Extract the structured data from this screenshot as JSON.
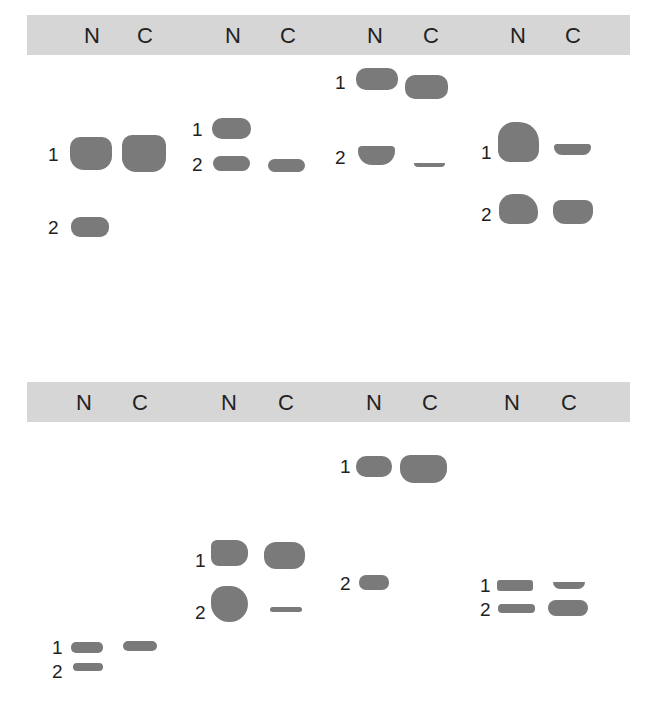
{
  "panels": [
    {
      "name": "top",
      "bar_top": 15,
      "lane_labels": [
        "N",
        "C",
        "N",
        "C",
        "N",
        "C",
        "N",
        "C"
      ],
      "lane_x": [
        92,
        145,
        233,
        288,
        375,
        431,
        518,
        573
      ],
      "label_y": 25,
      "band_labels": [
        {
          "text": "1",
          "x": 48,
          "y": 145
        },
        {
          "text": "2",
          "x": 48,
          "y": 218
        },
        {
          "text": "1",
          "x": 192,
          "y": 120
        },
        {
          "text": "2",
          "x": 192,
          "y": 155
        },
        {
          "text": "1",
          "x": 335,
          "y": 73
        },
        {
          "text": "2",
          "x": 335,
          "y": 148
        },
        {
          "text": "1",
          "x": 481,
          "y": 143
        },
        {
          "text": "2",
          "x": 481,
          "y": 205
        }
      ],
      "bands": [
        {
          "x": 70,
          "y": 137,
          "w": 42,
          "h": 33,
          "r": "10px 10px 14px 14px"
        },
        {
          "x": 122,
          "y": 135,
          "w": 44,
          "h": 37,
          "r": "10px 10px 14px 14px"
        },
        {
          "x": 71,
          "y": 217,
          "w": 38,
          "h": 20,
          "r": "9px"
        },
        {
          "x": 212,
          "y": 118,
          "w": 39,
          "h": 21,
          "r": "10px"
        },
        {
          "x": 213,
          "y": 156,
          "w": 37,
          "h": 15,
          "r": "8px"
        },
        {
          "x": 268,
          "y": 159,
          "w": 37,
          "h": 13,
          "r": "7px"
        },
        {
          "x": 356,
          "y": 68,
          "w": 42,
          "h": 22,
          "r": "10px"
        },
        {
          "x": 405,
          "y": 75,
          "w": 43,
          "h": 24,
          "r": "10px"
        },
        {
          "x": 358,
          "y": 146,
          "w": 37,
          "h": 19,
          "r": "4px 4px 14px 14px"
        },
        {
          "x": 414,
          "y": 163,
          "w": 31,
          "h": 4,
          "r": "0 0 10px 10px"
        },
        {
          "x": 498,
          "y": 122,
          "w": 41,
          "h": 40,
          "r": "16px 20px 12px 12px"
        },
        {
          "x": 554,
          "y": 144,
          "w": 37,
          "h": 11,
          "r": "4px 4px 10px 10px"
        },
        {
          "x": 499,
          "y": 194,
          "w": 39,
          "h": 30,
          "r": "14px 18px 10px 10px"
        },
        {
          "x": 553,
          "y": 200,
          "w": 40,
          "h": 24,
          "r": "8px 8px 12px 12px"
        }
      ]
    },
    {
      "name": "bottom",
      "bar_top": 382,
      "lane_labels": [
        "N",
        "C",
        "N",
        "C",
        "N",
        "C",
        "N",
        "C"
      ],
      "lane_x": [
        84,
        140,
        229,
        286,
        374,
        430,
        512,
        569
      ],
      "label_y": 392,
      "band_labels": [
        {
          "text": "1",
          "x": 52,
          "y": 638
        },
        {
          "text": "2",
          "x": 52,
          "y": 662
        },
        {
          "text": "1",
          "x": 195,
          "y": 551
        },
        {
          "text": "2",
          "x": 195,
          "y": 603
        },
        {
          "text": "1",
          "x": 340,
          "y": 457
        },
        {
          "text": "2",
          "x": 340,
          "y": 574
        },
        {
          "text": "1",
          "x": 480,
          "y": 576
        },
        {
          "text": "2",
          "x": 480,
          "y": 600
        }
      ],
      "bands": [
        {
          "x": 71,
          "y": 642,
          "w": 32,
          "h": 11,
          "r": "5px"
        },
        {
          "x": 123,
          "y": 641,
          "w": 34,
          "h": 10,
          "r": "5px"
        },
        {
          "x": 73,
          "y": 663,
          "w": 30,
          "h": 8,
          "r": "4px"
        },
        {
          "x": 211,
          "y": 540,
          "w": 37,
          "h": 26,
          "r": "6px 12px 12px 8px"
        },
        {
          "x": 264,
          "y": 542,
          "w": 41,
          "h": 27,
          "r": "12px"
        },
        {
          "x": 211,
          "y": 586,
          "w": 37,
          "h": 36,
          "r": "14px 18px 18px 18px"
        },
        {
          "x": 270,
          "y": 607,
          "w": 32,
          "h": 5,
          "r": "3px"
        },
        {
          "x": 356,
          "y": 456,
          "w": 36,
          "h": 21,
          "r": "10px"
        },
        {
          "x": 400,
          "y": 455,
          "w": 47,
          "h": 28,
          "r": "10px 10px 14px 14px"
        },
        {
          "x": 359,
          "y": 575,
          "w": 30,
          "h": 15,
          "r": "7px"
        },
        {
          "x": 497,
          "y": 580,
          "w": 36,
          "h": 11,
          "r": "3px"
        },
        {
          "x": 553,
          "y": 582,
          "w": 32,
          "h": 7,
          "r": "0 0 10px 10px"
        },
        {
          "x": 498,
          "y": 604,
          "w": 37,
          "h": 9,
          "r": "4px"
        },
        {
          "x": 548,
          "y": 600,
          "w": 40,
          "h": 16,
          "r": "8px"
        }
      ]
    }
  ]
}
